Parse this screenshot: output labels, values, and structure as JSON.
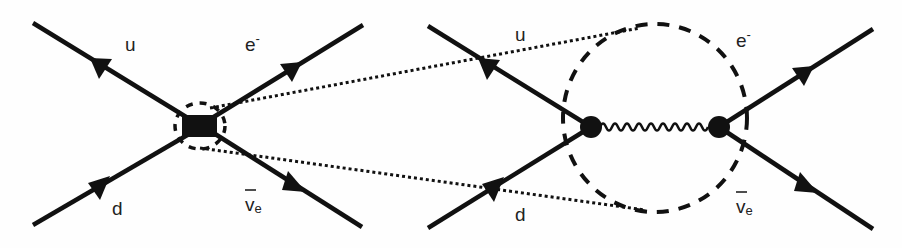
{
  "diagrams": [
    {
      "name": "effective-four-fermion-interaction",
      "vertex": "contact-square",
      "labels": {
        "u": "u",
        "d": "d",
        "electron": "e",
        "electron_sup": "-",
        "antineutrino": "v",
        "antineutrino_sub": "e"
      }
    },
    {
      "name": "w-boson-exchange",
      "vertex": "two-dots-wavy-propagator",
      "labels": {
        "u": "u",
        "d": "d",
        "electron": "e",
        "electron_sup": "-",
        "antineutrino": "v",
        "antineutrino_sub": "e"
      }
    }
  ],
  "annotations": {
    "zoom_lines": "dotted",
    "zoom_region": "dashed-circle"
  },
  "colors": {
    "line": "#111111",
    "background": "#fefefe"
  }
}
